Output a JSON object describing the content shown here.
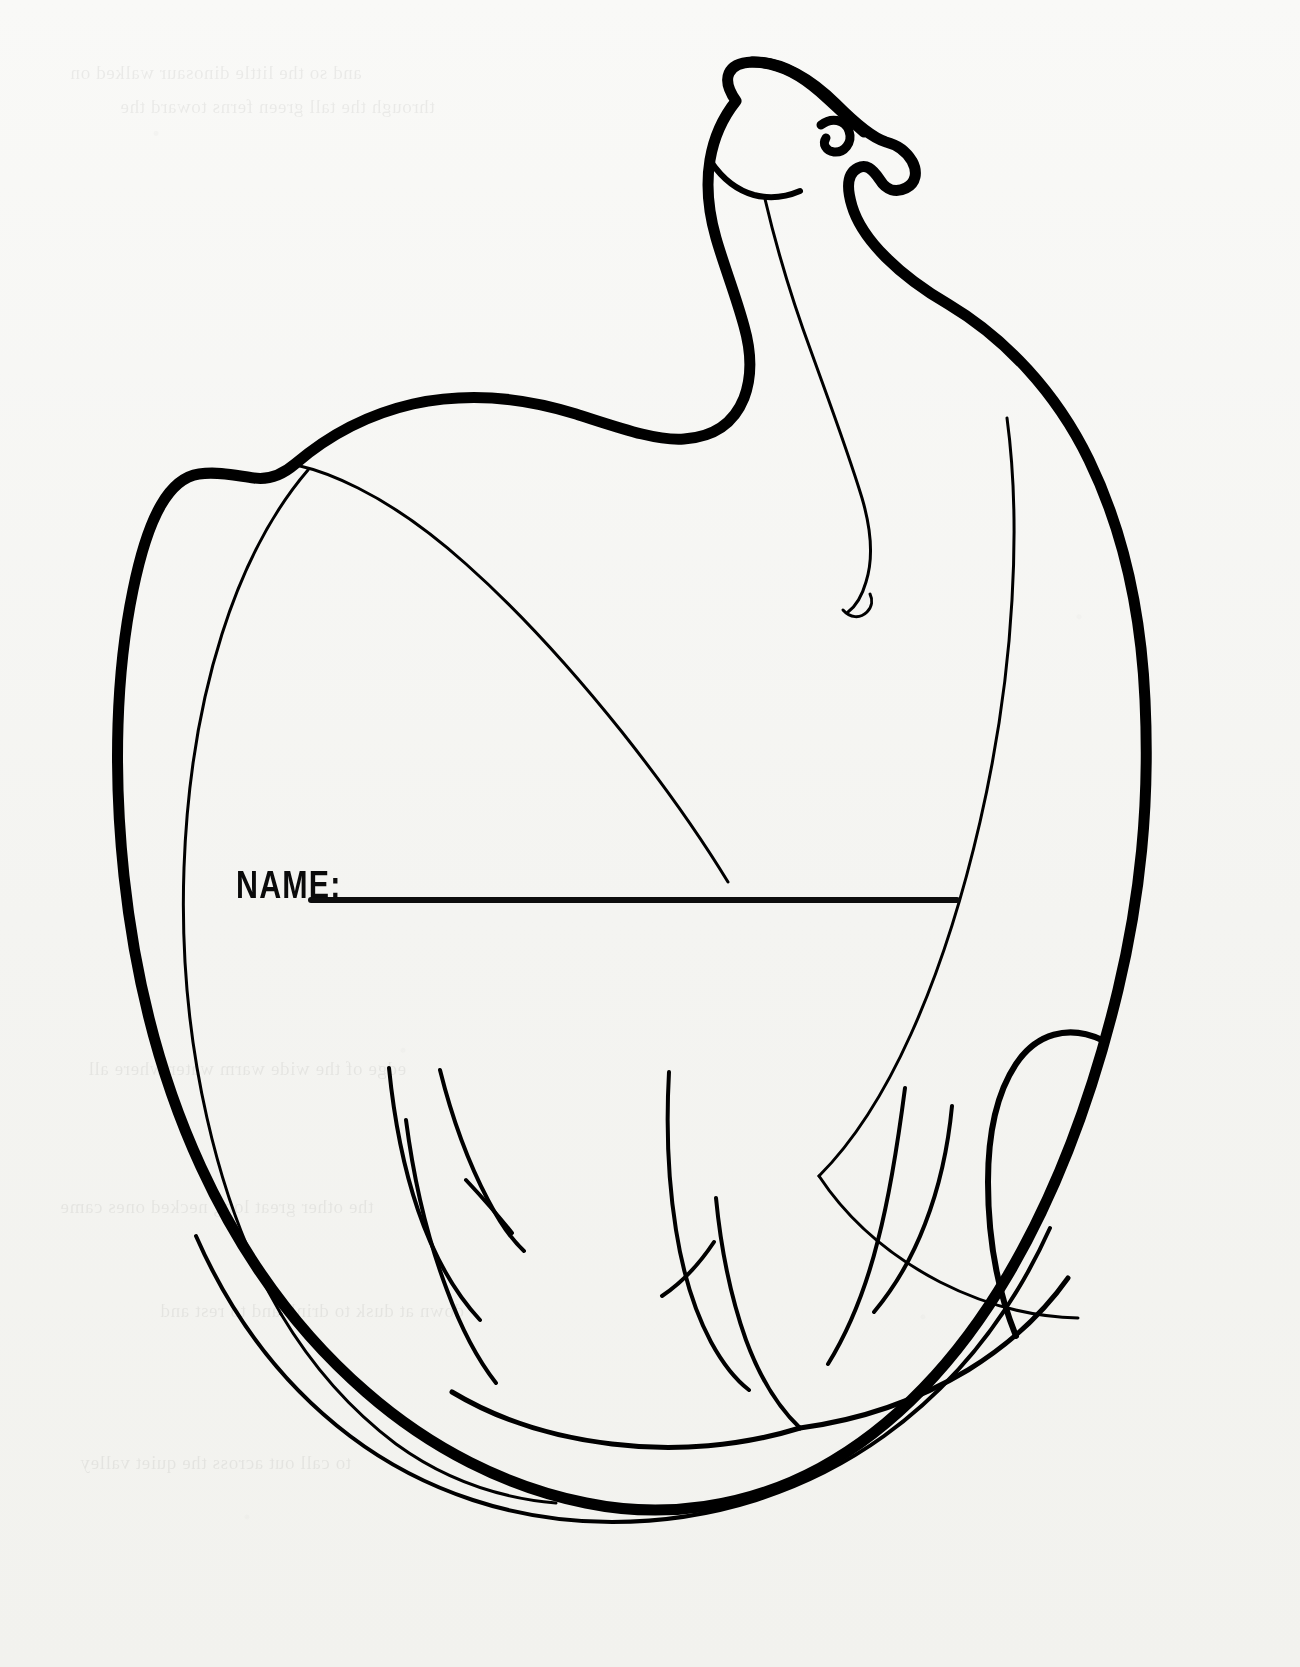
{
  "page": {
    "kind": "coloring-page",
    "background_color": "#fbfbfa",
    "ink_color": "#000000",
    "width": 1300,
    "height": 1667
  },
  "form": {
    "name_label": "NAME:",
    "name_value": "",
    "name_placeholder": ""
  },
  "artwork": {
    "subject": "brontosaurus",
    "style": "black line art outline, coloring book",
    "description": "A long-necked sauropod dinosaur curled into a circle, head raised and facing up-right",
    "outline_color": "#000000",
    "thick_stroke_px": 11,
    "thin_stroke_px": 3,
    "parts": [
      "head",
      "eye",
      "mouth",
      "nostril-snout",
      "neck",
      "back",
      "body",
      "tail",
      "front-leg",
      "hind-leg",
      "belly"
    ]
  },
  "bleed_through": {
    "visible": true,
    "note": "faint mirrored text showing through from reverse of the sheet",
    "lines": [
      "and so the little dinosaur walked on",
      "through the tall green ferns toward the",
      "edge of the wide warm water where all",
      "the other great long necked ones came",
      "down at dusk to drink and to rest and",
      "to call out across the quiet valley"
    ]
  }
}
